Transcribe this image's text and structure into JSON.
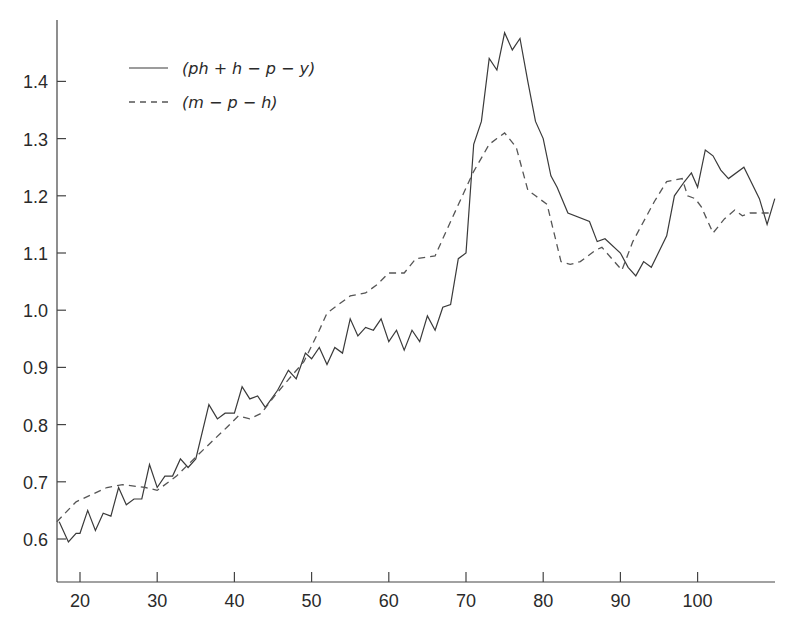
{
  "chart_data": {
    "type": "line",
    "title": "",
    "xlabel": "",
    "ylabel": "",
    "xlim": [
      17,
      110
    ],
    "ylim": [
      0.55,
      1.5
    ],
    "grid": false,
    "legend_position": "upper-left",
    "x_ticks": [
      20,
      30,
      40,
      50,
      60,
      70,
      80,
      90,
      100
    ],
    "x_tick_labels": [
      "20",
      "30",
      "40",
      "50",
      "60",
      "70",
      "80",
      "90",
      "100"
    ],
    "y_ticks": [
      0.6,
      0.7,
      0.8,
      0.9,
      1.0,
      1.1,
      1.2,
      1.3,
      1.4
    ],
    "y_tick_labels": [
      "0.6",
      "0.7",
      "0.8",
      "0.9",
      "1.0",
      "1.1",
      "1.2",
      "1.3",
      "1.4"
    ],
    "series": [
      {
        "name": "(ph + h − p − y)",
        "style": "solid",
        "color": "#3a3a3a",
        "x": [
          17.3,
          18.5,
          19.5,
          20,
          21,
          22,
          23,
          24,
          25,
          26,
          27,
          28,
          29,
          30,
          31,
          32,
          33,
          34,
          35,
          36.7,
          37.8,
          38.8,
          40,
          41,
          42,
          43,
          44,
          45.6,
          47,
          48,
          49.2,
          50,
          51,
          52,
          53,
          54,
          55,
          56,
          57,
          58,
          59,
          60,
          61,
          62,
          63,
          64,
          65,
          66,
          67,
          68,
          69,
          70,
          71,
          72,
          73,
          74,
          75,
          76,
          77,
          78,
          79,
          80,
          81,
          81.8,
          83.2,
          86,
          87,
          88,
          90,
          91,
          92,
          93,
          94,
          96,
          97,
          98.3,
          99.2,
          100,
          101,
          102,
          103,
          104,
          106,
          108,
          109,
          110
        ],
        "values": [
          0.63,
          0.595,
          0.61,
          0.61,
          0.65,
          0.615,
          0.645,
          0.64,
          0.69,
          0.66,
          0.67,
          0.67,
          0.73,
          0.69,
          0.71,
          0.71,
          0.74,
          0.725,
          0.74,
          0.835,
          0.81,
          0.82,
          0.82,
          0.866,
          0.845,
          0.85,
          0.83,
          0.86,
          0.895,
          0.88,
          0.925,
          0.915,
          0.935,
          0.905,
          0.935,
          0.925,
          0.985,
          0.955,
          0.97,
          0.965,
          0.985,
          0.945,
          0.965,
          0.93,
          0.965,
          0.945,
          0.99,
          0.965,
          1.005,
          1.01,
          1.09,
          1.1,
          1.29,
          1.33,
          1.44,
          1.42,
          1.485,
          1.455,
          1.475,
          1.4,
          1.33,
          1.3,
          1.235,
          1.215,
          1.17,
          1.155,
          1.12,
          1.125,
          1.1,
          1.075,
          1.06,
          1.085,
          1.075,
          1.13,
          1.2,
          1.225,
          1.24,
          1.215,
          1.28,
          1.27,
          1.245,
          1.23,
          1.25,
          1.195,
          1.15,
          1.195
        ]
      },
      {
        "name": "(m − p − h)",
        "style": "dashed",
        "color": "#555555",
        "x": [
          17,
          19.5,
          23.5,
          25.5,
          28.5,
          30,
          32.5,
          35.5,
          39,
          40.5,
          42,
          43.5,
          45.2,
          47.4,
          49,
          51,
          52,
          53.5,
          55,
          57,
          58.5,
          60,
          62,
          63.5,
          66,
          67.5,
          70.9,
          73,
          74,
          75,
          76.5,
          78,
          79,
          80.5,
          82.3,
          83.5,
          84.8,
          86.8,
          87.6,
          90.2,
          91.6,
          94.4,
          96,
          98,
          98.7,
          99.7,
          100.5,
          102,
          103.5,
          104.8,
          105.8,
          106.8,
          109.3
        ],
        "values": [
          0.63,
          0.665,
          0.69,
          0.695,
          0.69,
          0.685,
          0.71,
          0.75,
          0.795,
          0.815,
          0.81,
          0.82,
          0.85,
          0.885,
          0.91,
          0.965,
          0.995,
          1.01,
          1.025,
          1.03,
          1.045,
          1.065,
          1.065,
          1.09,
          1.095,
          1.14,
          1.24,
          1.29,
          1.3,
          1.31,
          1.285,
          1.21,
          1.2,
          1.185,
          1.085,
          1.08,
          1.085,
          1.105,
          1.11,
          1.07,
          1.12,
          1.19,
          1.225,
          1.23,
          1.2,
          1.195,
          1.18,
          1.135,
          1.16,
          1.175,
          1.165,
          1.17,
          1.17
        ]
      }
    ]
  },
  "legend": {
    "items": [
      {
        "label": "(ph + h − p − y)",
        "style": "solid"
      },
      {
        "label": "(m − p − h)",
        "style": "dashed"
      }
    ]
  }
}
